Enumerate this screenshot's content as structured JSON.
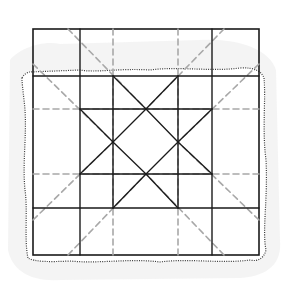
{
  "diagram": {
    "canvas": {
      "width": 283,
      "height": 284,
      "background": "#ffffff"
    },
    "colors": {
      "solid": "#1a1a1a",
      "dashed": "#a8a8a8",
      "paper_edge": "#3a3a3a",
      "paper_shadow": "#ececec"
    },
    "paper": {
      "outline": "M22,78 C24,74 28,72 30,72 L80,70 C95,73 120,68 150,70 C180,66 210,72 240,68 C255,67 262,72 264,78 C266,100 262,130 266,160 C268,200 262,230 266,250 C264,258 258,262 250,260 C220,264 190,258 160,262 C130,258 100,264 70,261 C50,262 35,262 28,258 C24,240 28,210 25,190 C22,160 28,130 24,100 C23,90 22,84 22,78 Z",
      "shadow": "M10,60 C18,50 40,40 60,44 L200,40 C240,38 270,50 276,70 L280,240 C282,262 270,276 240,278 L60,280 C30,282 12,270 8,250 Z"
    },
    "grid": {
      "outer": {
        "x": 33,
        "y": 29,
        "w": 226,
        "h": 226
      },
      "solid_lines": [
        {
          "x1": 80,
          "y1": 29,
          "x2": 80,
          "y2": 255
        },
        {
          "x1": 212,
          "y1": 29,
          "x2": 212,
          "y2": 255
        },
        {
          "x1": 33,
          "y1": 76,
          "x2": 259,
          "y2": 76
        },
        {
          "x1": 33,
          "y1": 208,
          "x2": 259,
          "y2": 208
        },
        {
          "x1": 113,
          "y1": 76,
          "x2": 113,
          "y2": 208
        },
        {
          "x1": 178,
          "y1": 76,
          "x2": 178,
          "y2": 208
        },
        {
          "x1": 80,
          "y1": 109,
          "x2": 212,
          "y2": 109
        },
        {
          "x1": 80,
          "y1": 174,
          "x2": 212,
          "y2": 174
        }
      ],
      "star_lines": [
        {
          "x1": 113,
          "y1": 76,
          "x2": 146,
          "y2": 109
        },
        {
          "x1": 146,
          "y1": 109,
          "x2": 178,
          "y2": 76
        },
        {
          "x1": 113,
          "y1": 208,
          "x2": 146,
          "y2": 174
        },
        {
          "x1": 146,
          "y1": 174,
          "x2": 178,
          "y2": 208
        },
        {
          "x1": 80,
          "y1": 109,
          "x2": 113,
          "y2": 142
        },
        {
          "x1": 113,
          "y1": 142,
          "x2": 80,
          "y2": 174
        },
        {
          "x1": 212,
          "y1": 109,
          "x2": 178,
          "y2": 142
        },
        {
          "x1": 178,
          "y1": 142,
          "x2": 212,
          "y2": 174
        },
        {
          "x1": 113,
          "y1": 142,
          "x2": 146,
          "y2": 109
        },
        {
          "x1": 146,
          "y1": 109,
          "x2": 178,
          "y2": 142
        },
        {
          "x1": 178,
          "y1": 142,
          "x2": 146,
          "y2": 174
        },
        {
          "x1": 146,
          "y1": 174,
          "x2": 113,
          "y2": 142
        }
      ],
      "dashed_lines": [
        {
          "x1": 113,
          "y1": 29,
          "x2": 113,
          "y2": 255
        },
        {
          "x1": 178,
          "y1": 29,
          "x2": 178,
          "y2": 255
        },
        {
          "x1": 33,
          "y1": 109,
          "x2": 259,
          "y2": 109
        },
        {
          "x1": 33,
          "y1": 174,
          "x2": 259,
          "y2": 174
        },
        {
          "x1": 68,
          "y1": 29,
          "x2": 146,
          "y2": 109
        },
        {
          "x1": 224,
          "y1": 29,
          "x2": 146,
          "y2": 109
        },
        {
          "x1": 68,
          "y1": 255,
          "x2": 146,
          "y2": 174
        },
        {
          "x1": 224,
          "y1": 255,
          "x2": 146,
          "y2": 174
        },
        {
          "x1": 33,
          "y1": 64,
          "x2": 113,
          "y2": 142
        },
        {
          "x1": 33,
          "y1": 220,
          "x2": 113,
          "y2": 142
        },
        {
          "x1": 259,
          "y1": 64,
          "x2": 178,
          "y2": 142
        },
        {
          "x1": 259,
          "y1": 220,
          "x2": 178,
          "y2": 142
        }
      ]
    }
  }
}
